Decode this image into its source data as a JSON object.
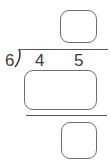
{
  "problem": {
    "type": "long-division",
    "divisor": "6",
    "dividend_digits": [
      "4",
      "5"
    ],
    "quotient_box": "",
    "product_box": "",
    "remainder_box": ""
  },
  "colors": {
    "stroke": "#6e6e6e",
    "text": "#3c3c3c",
    "background": "#ffffff"
  }
}
